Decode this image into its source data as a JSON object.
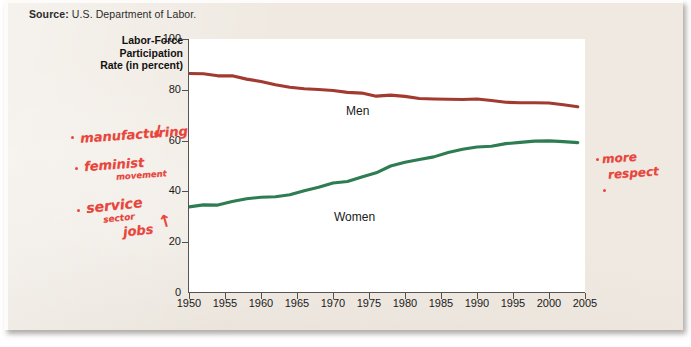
{
  "source": {
    "label": "Source:",
    "text": "U.S. Department of Labor."
  },
  "axis_title": {
    "line1": "Labor-Force",
    "line2": "Participation",
    "line3": "Rate (in percent)"
  },
  "annotations": {
    "manufacturing": "manufacturing",
    "manufacturing_arrow": "↓",
    "feminist": "feminist",
    "feminist_sub": "movement",
    "service": "service",
    "service_sub": "sector",
    "service_jobs": "jobs",
    "service_arrow": "↑",
    "more": "more",
    "respect": "respect"
  },
  "colors": {
    "men_line": "#a33a30",
    "women_line": "#2e7d52",
    "paper": "#efe9e1",
    "annotation": "#e8453c"
  },
  "chart_data": {
    "type": "line",
    "title": "",
    "xlabel": "",
    "ylabel": "Labor-Force Participation Rate (in percent)",
    "xlim": [
      1950,
      2005
    ],
    "ylim": [
      0,
      100
    ],
    "grid": false,
    "legend": "inline-labels",
    "xticks": [
      1950,
      1955,
      1960,
      1965,
      1970,
      1975,
      1980,
      1985,
      1990,
      1995,
      2000,
      2005
    ],
    "yticks": [
      0,
      20,
      40,
      60,
      80,
      100
    ],
    "x": [
      1950,
      1952,
      1954,
      1956,
      1958,
      1960,
      1962,
      1964,
      1966,
      1968,
      1970,
      1972,
      1974,
      1976,
      1978,
      1980,
      1982,
      1984,
      1986,
      1988,
      1990,
      1992,
      1994,
      1996,
      1998,
      2000,
      2002,
      2004
    ],
    "series": [
      {
        "name": "Men",
        "color": "#a33a30",
        "values": [
          86.4,
          86.3,
          85.5,
          85.5,
          84.2,
          83.3,
          82.0,
          81.0,
          80.4,
          80.1,
          79.7,
          79.0,
          78.7,
          77.5,
          77.9,
          77.4,
          76.6,
          76.4,
          76.3,
          76.2,
          76.4,
          75.8,
          75.1,
          74.9,
          74.9,
          74.8,
          74.1,
          73.3
        ]
      },
      {
        "name": "Women",
        "color": "#2e7d52",
        "values": [
          33.9,
          34.7,
          34.6,
          36.0,
          37.1,
          37.7,
          37.9,
          38.7,
          40.3,
          41.6,
          43.3,
          43.9,
          45.7,
          47.3,
          50.0,
          51.5,
          52.6,
          53.6,
          55.3,
          56.6,
          57.5,
          57.8,
          58.8,
          59.3,
          59.8,
          59.9,
          59.6,
          59.2
        ]
      }
    ]
  }
}
